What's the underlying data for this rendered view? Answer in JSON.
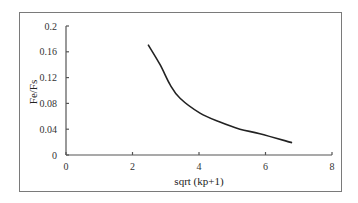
{
  "chart_data": {
    "type": "line",
    "title": "",
    "xlabel": "sqrt (kp+1)",
    "ylabel": "Fe/Fs",
    "xlim": [
      0,
      8
    ],
    "ylim": [
      0,
      0.2
    ],
    "x_ticks": [
      "0",
      "2",
      "4",
      "6",
      "8"
    ],
    "y_ticks": [
      "0",
      "0.04",
      "0.08",
      "0.12",
      "0.16",
      "0.2"
    ],
    "grid": false,
    "legend": null,
    "series": [
      {
        "name": "Fe/Fs",
        "color": "#222222",
        "x": [
          2.47,
          2.83,
          3.13,
          3.43,
          4.03,
          4.63,
          5.23,
          5.83,
          6.8
        ],
        "y": [
          0.171,
          0.14,
          0.109,
          0.088,
          0.065,
          0.051,
          0.04,
          0.033,
          0.019
        ]
      }
    ]
  }
}
